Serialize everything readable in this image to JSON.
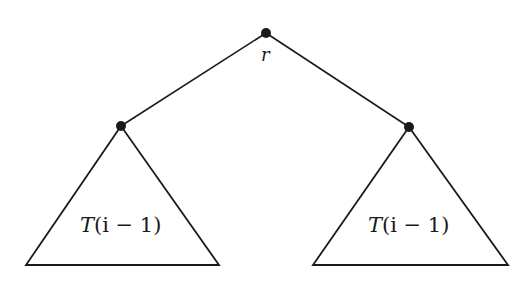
{
  "diagram": {
    "type": "binary-tree-recursive",
    "root": {
      "label": "r",
      "x": 266,
      "y": 33
    },
    "children": [
      {
        "name": "left",
        "x": 121,
        "y": 126,
        "subtree_label": "T(i − 1)",
        "triangle": {
          "apex": [
            121,
            126
          ],
          "base_left": [
            26,
            265
          ],
          "base_right": [
            219,
            265
          ]
        }
      },
      {
        "name": "right",
        "x": 409,
        "y": 127,
        "subtree_label": "T(i − 1)",
        "triangle": {
          "apex": [
            409,
            127
          ],
          "base_left": [
            313,
            265
          ],
          "base_right": [
            508,
            265
          ]
        }
      }
    ],
    "colors": {
      "stroke": "#1a1a1a",
      "background": "#ffffff"
    }
  },
  "labels": {
    "root": "r",
    "left_T": "T",
    "left_args": "(i − 1)",
    "right_T": "T",
    "right_args": "(i − 1)"
  }
}
